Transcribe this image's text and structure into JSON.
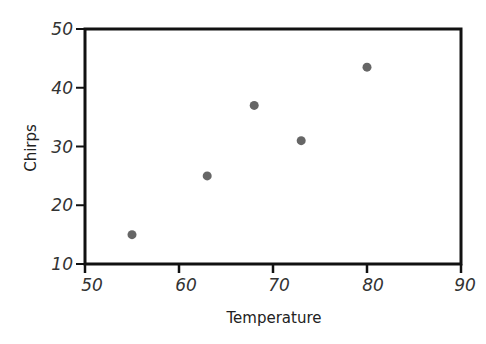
{
  "chart_data": {
    "type": "scatter",
    "title": "",
    "xlabel": "Temperature",
    "ylabel": "Chirps",
    "xlim": [
      50,
      90
    ],
    "ylim": [
      10,
      50
    ],
    "xticks": [
      50,
      60,
      70,
      80,
      90
    ],
    "yticks": [
      10,
      20,
      30,
      40,
      50
    ],
    "grid": false,
    "legend": null,
    "series": [
      {
        "name": "Chirps vs Temperature",
        "color": "#666666",
        "points": [
          {
            "x": 55,
            "y": 15
          },
          {
            "x": 63,
            "y": 25
          },
          {
            "x": 68,
            "y": 37
          },
          {
            "x": 73,
            "y": 31
          },
          {
            "x": 80,
            "y": 43.5
          }
        ]
      }
    ]
  },
  "labels": {
    "xlabel": "Temperature",
    "ylabel": "Chirps",
    "xticks": [
      "50",
      "60",
      "70",
      "80",
      "90"
    ],
    "yticks": [
      "10",
      "20",
      "30",
      "40",
      "50"
    ]
  },
  "colors": {
    "axis": "#111111",
    "point": "#666666",
    "text": "#333333"
  }
}
